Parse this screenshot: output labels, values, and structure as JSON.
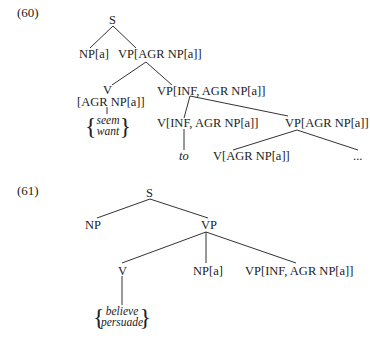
{
  "examples": [
    {
      "number": "(60)",
      "nodes": {
        "s": "S",
        "np_a": "NP[a]",
        "vp_agr": "VP[AGR NP[a]]",
        "v": "V",
        "v_feat": "[AGR NP[a]]",
        "verbs": [
          "seem",
          "want"
        ],
        "vp_inf": "VP[INF, AGR NP[a]]",
        "v_inf": "V[INF, AGR NP[a]]",
        "vp_agr2": "VP[AGR NP[a]]",
        "to": "to",
        "v_agr": "V[AGR NP[a]]",
        "ellipsis": "..."
      }
    },
    {
      "number": "(61)",
      "nodes": {
        "s": "S",
        "np": "NP",
        "vp": "VP",
        "v": "V",
        "np_a": "NP[a]",
        "vp_inf": "VP[INF, AGR NP[a]]",
        "verbs": [
          "believe",
          "persuade"
        ]
      }
    }
  ]
}
